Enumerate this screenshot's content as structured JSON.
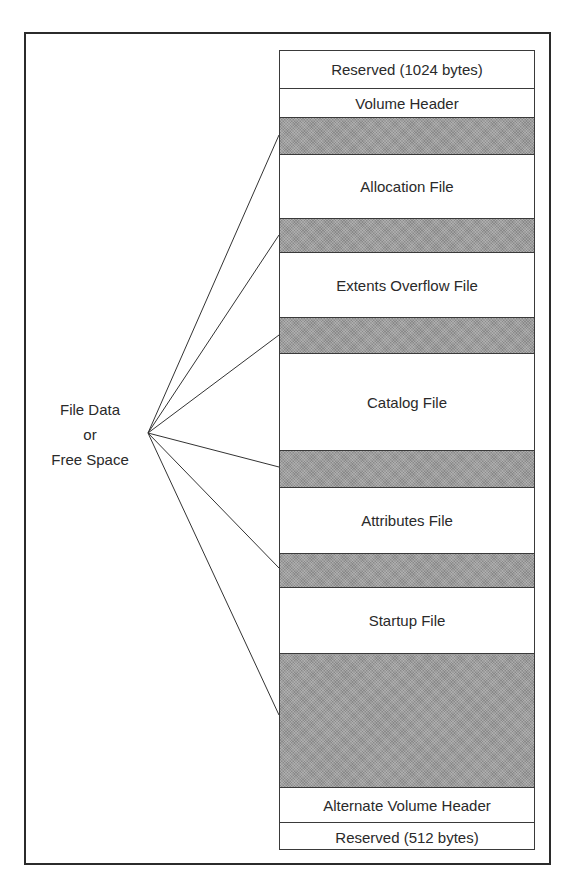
{
  "diagram": {
    "source_label": {
      "lines": [
        "File Data",
        "or",
        "Free Space"
      ]
    },
    "segments": [
      {
        "label": "Reserved (1024 bytes)",
        "type": "region",
        "top": 0,
        "height": 38
      },
      {
        "label": "Volume Header",
        "type": "region",
        "top": 38,
        "height": 29
      },
      {
        "label": "",
        "type": "free",
        "top": 67,
        "height": 37
      },
      {
        "label": "Allocation File",
        "type": "region",
        "top": 104,
        "height": 64
      },
      {
        "label": "",
        "type": "free",
        "top": 168,
        "height": 34
      },
      {
        "label": "Extents Overflow File",
        "type": "region",
        "top": 202,
        "height": 65
      },
      {
        "label": "",
        "type": "free",
        "top": 267,
        "height": 36
      },
      {
        "label": "Catalog File",
        "type": "region",
        "top": 303,
        "height": 97
      },
      {
        "label": "",
        "type": "free",
        "top": 400,
        "height": 37
      },
      {
        "label": "Attributes File",
        "type": "region",
        "top": 437,
        "height": 66
      },
      {
        "label": "",
        "type": "free",
        "top": 503,
        "height": 34
      },
      {
        "label": "Startup File",
        "type": "region",
        "top": 537,
        "height": 66
      },
      {
        "label": "",
        "type": "free",
        "top": 603,
        "height": 134
      },
      {
        "label": "Alternate Volume Header",
        "type": "region",
        "top": 737,
        "height": 35
      },
      {
        "label": "Reserved (512 bytes)",
        "type": "region",
        "top": 772,
        "height": 28
      }
    ],
    "connector_origin": {
      "x": 148,
      "y": 433
    },
    "connector_targets": [
      {
        "x": 279,
        "y": 135
      },
      {
        "x": 279,
        "y": 235
      },
      {
        "x": 279,
        "y": 335
      },
      {
        "x": 279,
        "y": 467
      },
      {
        "x": 279,
        "y": 568
      },
      {
        "x": 279,
        "y": 715
      }
    ],
    "colors": {
      "free_space_fill": "#9c9c9c",
      "border": "#3a3a3a",
      "text": "#2a2a2a"
    }
  }
}
